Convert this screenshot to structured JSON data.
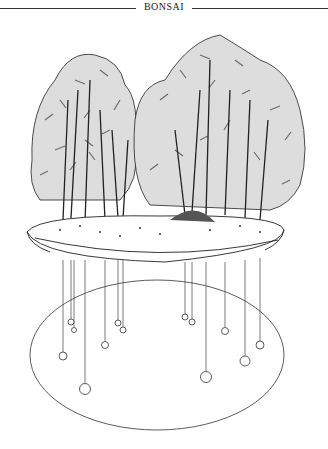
{
  "header": {
    "title": "BONSAI"
  },
  "figure": {
    "line_color": "#333333",
    "trunk_markers": [
      {
        "x": 63,
        "y": 356,
        "r": 4
      },
      {
        "x": 71,
        "y": 322,
        "r": 3
      },
      {
        "x": 74,
        "y": 330,
        "r": 2.5
      },
      {
        "x": 85,
        "y": 389,
        "r": 5.5
      },
      {
        "x": 105,
        "y": 345,
        "r": 3.5
      },
      {
        "x": 118,
        "y": 323,
        "r": 3
      },
      {
        "x": 123,
        "y": 330,
        "r": 3
      },
      {
        "x": 185,
        "y": 317,
        "r": 3
      },
      {
        "x": 192,
        "y": 322,
        "r": 3
      },
      {
        "x": 206,
        "y": 377,
        "r": 5.5
      },
      {
        "x": 225,
        "y": 331,
        "r": 3.5
      },
      {
        "x": 245,
        "y": 361,
        "r": 5
      },
      {
        "x": 260,
        "y": 345,
        "r": 4
      }
    ]
  }
}
